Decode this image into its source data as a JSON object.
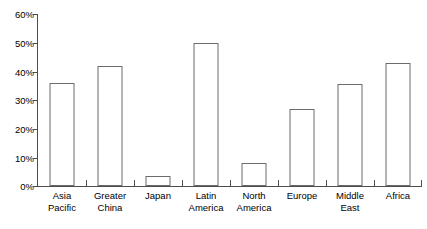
{
  "chart_data": {
    "type": "bar",
    "title": "",
    "subtitle": "",
    "xlabel": "",
    "ylabel": "",
    "ylim": [
      0,
      60
    ],
    "ytick_labels": [
      "0%",
      "10%",
      "20%",
      "30%",
      "40%",
      "50%",
      "60%"
    ],
    "ytick_values": [
      0,
      10,
      20,
      30,
      40,
      50,
      60
    ],
    "grid": false,
    "legend": null,
    "legend_position": "none",
    "categories": [
      "Asia Pacific",
      "Greater China",
      "Japan",
      "Latin America",
      "North America",
      "Europe",
      "Middle East",
      "Africa"
    ],
    "category_lines": [
      [
        "Asia",
        "Pacific"
      ],
      [
        "Greater",
        "China"
      ],
      [
        "Japan"
      ],
      [
        "Latin",
        "America"
      ],
      [
        "North",
        "America"
      ],
      [
        "Europe"
      ],
      [
        "Middle",
        "East"
      ],
      [
        "Africa"
      ]
    ],
    "values": [
      36,
      42,
      3.5,
      50,
      8,
      27,
      35.5,
      43
    ],
    "value_labels": [
      "36%",
      "42%",
      "3.5%",
      "50%",
      "8%",
      "27%",
      "35.5%",
      "43%"
    ],
    "bar_fill": "#ffffff",
    "bar_outline": "#6b6b6b",
    "axis_color": "#4d4d4d",
    "text_color": "#000000",
    "background": "#ffffff"
  }
}
